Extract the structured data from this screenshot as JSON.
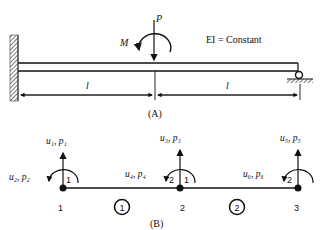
{
  "figure_a": {
    "caption": "(A)",
    "load_label": "P",
    "moment_label": "M",
    "stiffness_note": "EI = Constant",
    "span_labels": [
      "l",
      "l"
    ],
    "supports": {
      "left": "fixed",
      "right": "roller"
    }
  },
  "figure_b": {
    "caption": "(B)",
    "nodes": [
      {
        "id": "1",
        "dof_vertical": "u₁, p₁",
        "dof_rotation": "u₂, p₂",
        "end_labels": [
          "1"
        ]
      },
      {
        "id": "2",
        "dof_vertical": "u₃, p₃",
        "dof_rotation": "u₄, p₄",
        "end_labels": [
          "2",
          "1"
        ]
      },
      {
        "id": "3",
        "dof_vertical": "u₅, p₅",
        "dof_rotation": "u₆, p₆",
        "end_labels": [
          "2"
        ]
      }
    ],
    "elements": [
      "1",
      "2"
    ]
  }
}
